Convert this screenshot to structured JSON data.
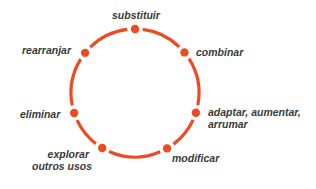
{
  "diagram": {
    "type": "cycle",
    "ring_color": "#EE4A22",
    "text_color": "#3A3A3A",
    "center": [
      135,
      93
    ],
    "radius": 64,
    "nodes": [
      {
        "id": "substituir",
        "label": "substituir",
        "dot": [
          135,
          29
        ]
      },
      {
        "id": "combinar",
        "label": "combinar",
        "dot": [
          185,
          52
        ]
      },
      {
        "id": "adaptar",
        "label_lines": [
          "adaptar, aumentar,",
          "arrumar"
        ],
        "dot": [
          200,
          114
        ]
      },
      {
        "id": "modificar",
        "label": "modificar",
        "dot": [
          168,
          150
        ]
      },
      {
        "id": "explorar",
        "label_lines": [
          "explorar",
          "outros usos"
        ],
        "dot": [
          101,
          150
        ]
      },
      {
        "id": "eliminar",
        "label": "eliminar",
        "dot": [
          71,
          114
        ]
      },
      {
        "id": "rearranjar",
        "label": "rearranjar",
        "dot": [
          84,
          52
        ]
      }
    ]
  }
}
